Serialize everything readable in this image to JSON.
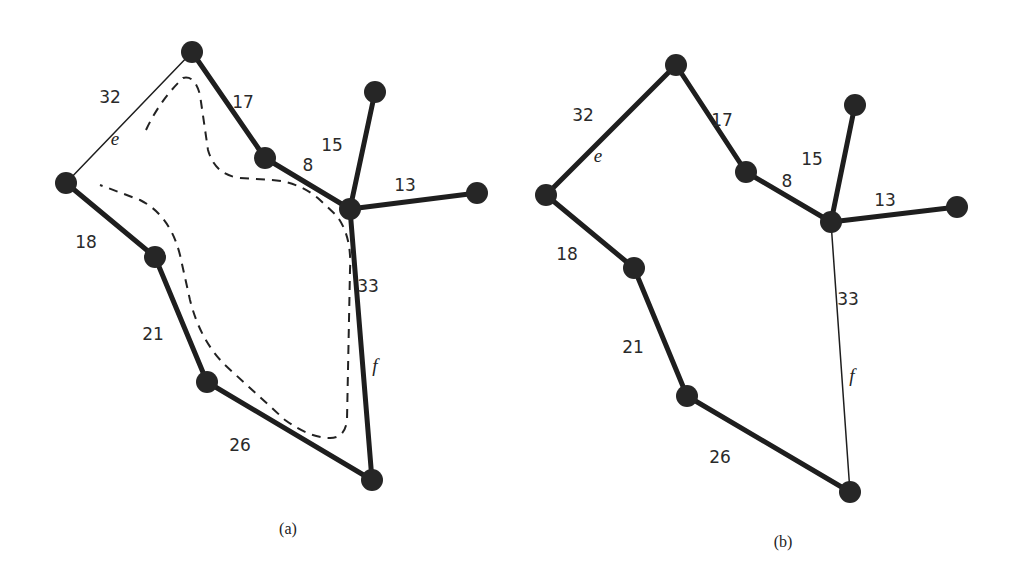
{
  "figure": {
    "panels": [
      {
        "id": "a",
        "caption": "(a)",
        "caption_pos": [
          288,
          534
        ],
        "nodes": [
          {
            "id": "top",
            "x": 192,
            "y": 52
          },
          {
            "id": "left",
            "x": 66,
            "y": 183
          },
          {
            "id": "inner",
            "x": 265,
            "y": 158
          },
          {
            "id": "center",
            "x": 350,
            "y": 209
          },
          {
            "id": "leaf-top",
            "x": 375,
            "y": 92
          },
          {
            "id": "leaf-right",
            "x": 477,
            "y": 193
          },
          {
            "id": "mid-left",
            "x": 155,
            "y": 257
          },
          {
            "id": "lower-left",
            "x": 207,
            "y": 382
          },
          {
            "id": "bottom",
            "x": 372,
            "y": 480
          }
        ],
        "edges": [
          {
            "from": "left",
            "to": "top",
            "weight": "32",
            "name": "e",
            "thick": false,
            "lx": 110,
            "ly": 103,
            "nx": 115,
            "ny": 145
          },
          {
            "from": "top",
            "to": "inner",
            "weight": "17",
            "thick": true,
            "lx": 243,
            "ly": 108
          },
          {
            "from": "inner",
            "to": "center",
            "weight": "8",
            "thick": true,
            "lx": 308,
            "ly": 171
          },
          {
            "from": "center",
            "to": "leaf-top",
            "weight": "15",
            "thick": true,
            "lx": 332,
            "ly": 151
          },
          {
            "from": "center",
            "to": "leaf-right",
            "weight": "13",
            "thick": true,
            "lx": 405,
            "ly": 191
          },
          {
            "from": "left",
            "to": "mid-left",
            "weight": "18",
            "thick": true,
            "lx": 86,
            "ly": 248
          },
          {
            "from": "mid-left",
            "to": "lower-left",
            "weight": "21",
            "thick": true,
            "lx": 153,
            "ly": 340
          },
          {
            "from": "lower-left",
            "to": "bottom",
            "weight": "26",
            "thick": true,
            "lx": 240,
            "ly": 451
          },
          {
            "from": "center",
            "to": "bottom",
            "weight": "33",
            "name": "f",
            "thick": true,
            "lx": 368,
            "ly": 292,
            "nx": 375,
            "ny": 372
          }
        ],
        "dashed_path": "M 146 130 Q 160 100 183 78 Q 195 75 200 95 L 208 150 Q 215 175 240 178 L 272 180 Q 300 182 320 200 L 336 215 Q 352 235 350 270 L 347 420 Q 345 438 330 438 Q 310 438 285 420 L 225 365 Q 200 340 190 300 L 180 255 Q 170 215 140 200 L 100 185"
      },
      {
        "id": "b",
        "caption": "(b)",
        "caption_pos": [
          783,
          547
        ],
        "nodes": [
          {
            "id": "top",
            "x": 676,
            "y": 65
          },
          {
            "id": "left",
            "x": 546,
            "y": 195
          },
          {
            "id": "inner",
            "x": 746,
            "y": 172
          },
          {
            "id": "center",
            "x": 831,
            "y": 222
          },
          {
            "id": "leaf-top",
            "x": 855,
            "y": 105
          },
          {
            "id": "leaf-right",
            "x": 957,
            "y": 207
          },
          {
            "id": "mid-left",
            "x": 634,
            "y": 268
          },
          {
            "id": "lower-left",
            "x": 687,
            "y": 396
          },
          {
            "id": "bottom",
            "x": 850,
            "y": 492
          }
        ],
        "edges": [
          {
            "from": "left",
            "to": "top",
            "weight": "32",
            "name": "e",
            "thick": true,
            "lx": 583,
            "ly": 121,
            "nx": 598,
            "ny": 162
          },
          {
            "from": "top",
            "to": "inner",
            "weight": "17",
            "thick": true,
            "lx": 722,
            "ly": 126
          },
          {
            "from": "inner",
            "to": "center",
            "weight": "8",
            "thick": true,
            "lx": 787,
            "ly": 187
          },
          {
            "from": "center",
            "to": "leaf-top",
            "weight": "15",
            "thick": true,
            "lx": 812,
            "ly": 165
          },
          {
            "from": "center",
            "to": "leaf-right",
            "weight": "13",
            "thick": true,
            "lx": 885,
            "ly": 206
          },
          {
            "from": "left",
            "to": "mid-left",
            "weight": "18",
            "thick": true,
            "lx": 567,
            "ly": 260
          },
          {
            "from": "mid-left",
            "to": "lower-left",
            "weight": "21",
            "thick": true,
            "lx": 633,
            "ly": 353
          },
          {
            "from": "lower-left",
            "to": "bottom",
            "weight": "26",
            "thick": true,
            "lx": 720,
            "ly": 463
          },
          {
            "from": "center",
            "to": "bottom",
            "weight": "33",
            "name": "f",
            "thick": false,
            "lx": 848,
            "ly": 305,
            "nx": 852,
            "ny": 382
          }
        ]
      }
    ]
  }
}
